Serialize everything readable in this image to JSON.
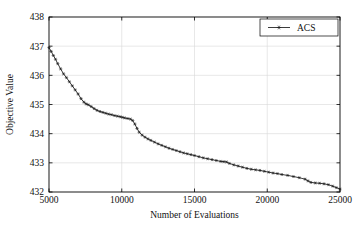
{
  "chart_data": {
    "type": "line",
    "title": "",
    "xlabel": "Number of Evaluations",
    "ylabel": "Objective Value",
    "xlim": [
      5000,
      25000
    ],
    "ylim": [
      432,
      438
    ],
    "xticks": [
      5000,
      10000,
      15000,
      20000,
      25000
    ],
    "xticklabels": [
      "5000",
      "10000",
      "15000",
      "20000",
      "25000"
    ],
    "yticks": [
      432,
      433,
      434,
      435,
      436,
      437,
      438
    ],
    "yticklabels": [
      "432",
      "433",
      "434",
      "435",
      "436",
      "437",
      "438"
    ],
    "grid": true,
    "legend": {
      "position": "top-right",
      "entries": [
        {
          "name": "ACS",
          "marker": "star",
          "color": "#1a1a1a"
        }
      ]
    },
    "series": [
      {
        "name": "ACS",
        "marker": "star",
        "color": "#1a1a1a",
        "x": [
          5000,
          5150,
          5300,
          5450,
          5600,
          5800,
          6000,
          6200,
          6400,
          6600,
          6800,
          7000,
          7200,
          7400,
          7550,
          7700,
          7900,
          8100,
          8300,
          8500,
          8700,
          8900,
          9100,
          9300,
          9500,
          9700,
          9900,
          10050,
          10200,
          10400,
          10600,
          10750,
          10900,
          11050,
          11200,
          11400,
          11600,
          11800,
          12000,
          12250,
          12500,
          12750,
          13000,
          13250,
          13500,
          13750,
          14000,
          14250,
          14500,
          14750,
          15000,
          15300,
          15600,
          15900,
          16200,
          16500,
          16800,
          17000,
          17200,
          17400,
          17700,
          18000,
          18300,
          18600,
          18900,
          19200,
          19500,
          19800,
          20100,
          20400,
          20700,
          21000,
          21400,
          21800,
          22200,
          22600,
          22800,
          23000,
          23300,
          23600,
          23900,
          24200,
          24500,
          24750,
          25000
        ],
        "y": [
          436.95,
          436.82,
          436.68,
          436.55,
          436.4,
          436.22,
          436.05,
          435.92,
          435.78,
          435.64,
          435.5,
          435.36,
          435.2,
          435.08,
          435.02,
          434.99,
          434.93,
          434.86,
          434.8,
          434.76,
          434.73,
          434.7,
          434.67,
          434.65,
          434.62,
          434.6,
          434.58,
          434.56,
          434.54,
          434.52,
          434.5,
          434.45,
          434.33,
          434.18,
          434.05,
          433.95,
          433.88,
          433.82,
          433.77,
          433.71,
          433.65,
          433.6,
          433.55,
          433.5,
          433.46,
          433.42,
          433.38,
          433.34,
          433.31,
          433.28,
          433.25,
          433.21,
          433.17,
          433.14,
          433.11,
          433.08,
          433.05,
          433.04,
          433.03,
          432.98,
          432.93,
          432.89,
          432.85,
          432.81,
          432.78,
          432.76,
          432.74,
          432.71,
          432.68,
          432.65,
          432.63,
          432.6,
          432.57,
          432.53,
          432.49,
          432.44,
          432.38,
          432.33,
          432.31,
          432.3,
          432.28,
          432.25,
          432.2,
          432.15,
          432.1
        ]
      }
    ]
  }
}
